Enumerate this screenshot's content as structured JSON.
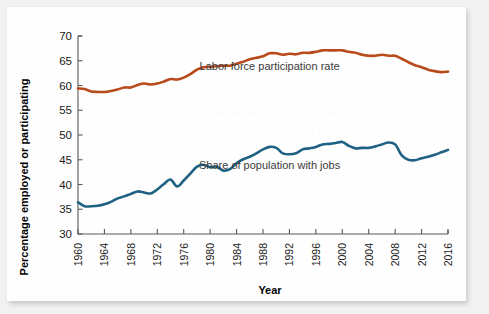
{
  "figure": {
    "background_color": "#fefefe",
    "outer_color": "#f2f2f2"
  },
  "chart_data": {
    "type": "line",
    "title": "",
    "xlabel": "Year",
    "ylabel": "Percentage employed or participating",
    "xlim": [
      1960,
      2016
    ],
    "ylim": [
      30,
      70
    ],
    "yticks": [
      30,
      35,
      40,
      45,
      50,
      55,
      60,
      65,
      70
    ],
    "xticks": [
      1960,
      1964,
      1968,
      1972,
      1976,
      1980,
      1984,
      1988,
      1992,
      1996,
      2000,
      2004,
      2008,
      2012,
      2016
    ],
    "grid": false,
    "legend_position": "inline-annotation",
    "x": [
      1960,
      1961,
      1962,
      1963,
      1964,
      1965,
      1966,
      1967,
      1968,
      1969,
      1970,
      1971,
      1972,
      1973,
      1974,
      1975,
      1976,
      1977,
      1978,
      1979,
      1980,
      1981,
      1982,
      1983,
      1984,
      1985,
      1986,
      1987,
      1988,
      1989,
      1990,
      1991,
      1992,
      1993,
      1994,
      1995,
      1996,
      1997,
      1998,
      1999,
      2000,
      2001,
      2002,
      2003,
      2004,
      2005,
      2006,
      2007,
      2008,
      2009,
      2010,
      2011,
      2012,
      2013,
      2014,
      2015,
      2016
    ],
    "series": [
      {
        "name": "Labor force participation rate",
        "color": "#b84a1c",
        "label_x": 1989,
        "label_y": 63.2,
        "values": [
          59.4,
          59.3,
          58.8,
          58.7,
          58.7,
          58.9,
          59.2,
          59.6,
          59.6,
          60.1,
          60.4,
          60.2,
          60.4,
          60.8,
          61.3,
          61.2,
          61.6,
          62.3,
          63.2,
          63.7,
          63.8,
          63.9,
          64.0,
          64.0,
          64.4,
          64.8,
          65.3,
          65.6,
          65.9,
          66.5,
          66.5,
          66.2,
          66.4,
          66.3,
          66.6,
          66.6,
          66.8,
          67.1,
          67.1,
          67.1,
          67.1,
          66.8,
          66.6,
          66.2,
          66.0,
          66.0,
          66.2,
          66.0,
          66.0,
          65.4,
          64.7,
          64.1,
          63.7,
          63.2,
          62.9,
          62.7,
          62.8
        ]
      },
      {
        "name": "Share of population with jobs",
        "color": "#1f6182",
        "label_x": 1989,
        "label_y": 43.1,
        "values": [
          36.4,
          35.6,
          35.6,
          35.7,
          36.0,
          36.5,
          37.2,
          37.6,
          38.1,
          38.6,
          38.4,
          38.2,
          39.0,
          40.1,
          41.0,
          39.6,
          40.8,
          42.2,
          43.6,
          44.0,
          43.5,
          43.6,
          42.8,
          43.1,
          44.3,
          45.1,
          45.6,
          46.3,
          47.1,
          47.6,
          47.4,
          46.3,
          46.1,
          46.3,
          47.1,
          47.3,
          47.6,
          48.1,
          48.2,
          48.4,
          48.6,
          47.8,
          47.3,
          47.4,
          47.4,
          47.7,
          48.1,
          48.5,
          48.1,
          45.9,
          45.0,
          44.9,
          45.3,
          45.6,
          46.0,
          46.5,
          47.0
        ]
      }
    ]
  },
  "ghost_text": [
    "the share of adults who are either working or actively",
    "looking for work has changed over recent decades as",
    "more women entered the paid labor force while some",
    "older men retired earlier than before, and then both"
  ]
}
